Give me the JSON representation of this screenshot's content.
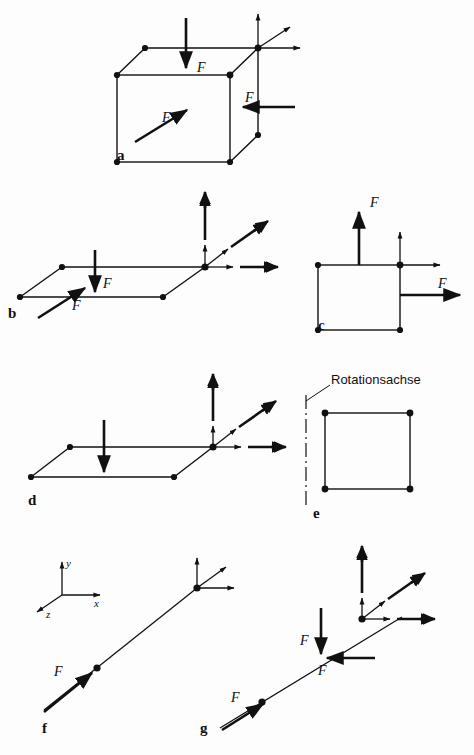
{
  "figure": {
    "background_color": "#fdfdfd",
    "stroke_color": "#111111",
    "width": 474,
    "height": 755
  },
  "panels": [
    {
      "id": "a",
      "letter": "a",
      "letter_pos": {
        "x": 117,
        "y": 160
      },
      "description": "Wuerfel mit drei Kraeften F",
      "force_labels": [
        {
          "text": "F",
          "x": 197,
          "y": 72
        },
        {
          "text": "F",
          "x": 245,
          "y": 102
        },
        {
          "text": "F",
          "x": 162,
          "y": 122
        }
      ]
    },
    {
      "id": "b",
      "letter": "b",
      "letter_pos": {
        "x": 8,
        "y": 318
      },
      "description": "Parallelogramm mit Kraft und Momentvektoren",
      "force_labels": [
        {
          "text": "F",
          "x": 103,
          "y": 288
        },
        {
          "text": "F",
          "x": 72,
          "y": 300
        }
      ]
    },
    {
      "id": "c",
      "letter": "c",
      "letter_pos": {
        "x": 318,
        "y": 329
      },
      "description": "Quadrat mit zwei Kraeften F",
      "force_labels": [
        {
          "text": "F",
          "x": 374,
          "y": 205
        },
        {
          "text": "F",
          "x": 443,
          "y": 290
        }
      ]
    },
    {
      "id": "d",
      "letter": "d",
      "letter_pos": {
        "x": 28,
        "y": 500
      },
      "description": "Parallelogramm mit Momentvektoren ohne Beschriftung",
      "force_labels": []
    },
    {
      "id": "e",
      "letter": "e",
      "letter_pos": {
        "x": 313,
        "y": 518
      },
      "description": "Quadrat mit Rotationsachse",
      "annotation": "Rotationsachse",
      "annotation_pos": {
        "x": 354,
        "y": 389
      },
      "force_labels": []
    },
    {
      "id": "f",
      "letter": "f",
      "letter_pos": {
        "x": 42,
        "y": 727
      },
      "description": "Wirkungslinie mit Kraft F und Koordinatensystem",
      "axes": [
        {
          "label": "y",
          "x": 72,
          "y": 565
        },
        {
          "label": "x",
          "x": 104,
          "y": 595
        },
        {
          "label": "z",
          "x": 49,
          "y": 613
        }
      ],
      "force_labels": [
        {
          "text": "F",
          "x": 60,
          "y": 676
        }
      ]
    },
    {
      "id": "g",
      "letter": "g",
      "letter_pos": {
        "x": 200,
        "y": 727
      },
      "description": "Wirkungslinie mit drei Kraeften F",
      "force_labels": [
        {
          "text": "F",
          "x": 236,
          "y": 697
        },
        {
          "text": "F",
          "x": 291,
          "y": 637
        },
        {
          "text": "F",
          "x": 325,
          "y": 665
        }
      ]
    }
  ]
}
